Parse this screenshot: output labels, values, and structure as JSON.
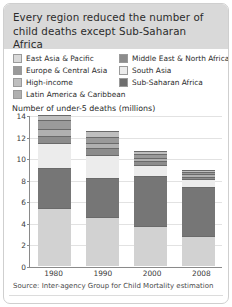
{
  "card": {
    "title": "Every region reduced the number of child deaths except Sub-Saharan Africa"
  },
  "legend": {
    "left": [
      {
        "label": "East Asia & Pacific",
        "color": "#d9d9d9",
        "key": "east-asia-pacific"
      },
      {
        "label": "Europe & Central Asia",
        "color": "#9a9a9a",
        "key": "europe-central-asia"
      },
      {
        "label": "High-income",
        "color": "#bfbfbf",
        "key": "high-income"
      },
      {
        "label": "Latin America & Caribbean",
        "color": "#b0b0b0",
        "key": "latin-america-caribbean"
      }
    ],
    "right": [
      {
        "label": "Middle East & North Africa",
        "color": "#8c8c8c",
        "key": "middle-east-north-africa"
      },
      {
        "label": "South Asia",
        "color": "#ececec",
        "key": "south-asia"
      },
      {
        "label": "Sub-Saharan Africa",
        "color": "#6e6e6e",
        "key": "sub-saharan-africa"
      }
    ]
  },
  "source": "Source: Inter-agency Group for Child Mortality estimation",
  "chart_data": {
    "type": "bar",
    "subtype": "stacked",
    "title": "Every region reduced the number of child deaths except Sub-Saharan Africa",
    "xlabel": "",
    "ylabel": "Number of under-5 deaths (millions)",
    "ylim": [
      0,
      14
    ],
    "yticks": [
      0,
      2,
      4,
      6,
      8,
      10,
      12,
      14
    ],
    "grid": true,
    "legend_position": "top",
    "categories": [
      "1980",
      "1990",
      "2000",
      "2008"
    ],
    "stack_order_bottom_to_top": [
      "Sub-Saharan Africa",
      "South Asia",
      "East Asia & Pacific",
      "Middle East & North Africa",
      "Latin America & Caribbean",
      "Europe & Central Asia",
      "High-income"
    ],
    "series": [
      {
        "name": "Sub-Saharan Africa",
        "color": "#d2d2d2",
        "values": [
          5.4,
          4.5,
          3.7,
          2.8
        ]
      },
      {
        "name": "South Asia",
        "color": "#767676",
        "values": [
          3.7,
          3.7,
          4.6,
          4.5
        ]
      },
      {
        "name": "East Asia & Pacific",
        "color": "#ececec",
        "values": [
          2.3,
          2.1,
          1.1,
          0.8
        ]
      },
      {
        "name": "Middle East & North Africa",
        "color": "#8c8c8c",
        "values": [
          0.7,
          0.6,
          0.3,
          0.2
        ]
      },
      {
        "name": "Latin America & Caribbean",
        "color": "#b0b0b0",
        "values": [
          0.6,
          0.5,
          0.3,
          0.2
        ]
      },
      {
        "name": "Europe & Central Asia",
        "color": "#9a9a9a",
        "values": [
          0.8,
          0.6,
          0.4,
          0.2
        ]
      },
      {
        "name": "High-income",
        "color": "#bfbfbf",
        "values": [
          0.5,
          0.5,
          0.3,
          0.2
        ]
      }
    ],
    "totals": [
      14.0,
      12.5,
      10.7,
      8.9
    ]
  }
}
